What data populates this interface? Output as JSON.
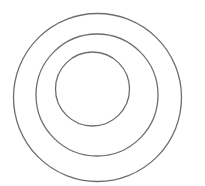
{
  "diagram": {
    "type": "concentric-circles",
    "background": "#ffffff",
    "stroke": "#6e6e6e",
    "circles": [
      {
        "name": "outer",
        "cx": 97.5,
        "cy": 97.5,
        "r": 84
      },
      {
        "name": "middle",
        "cx": 97,
        "cy": 95,
        "r": 61
      },
      {
        "name": "inner",
        "cx": 92.5,
        "cy": 89,
        "r": 37
      }
    ]
  }
}
